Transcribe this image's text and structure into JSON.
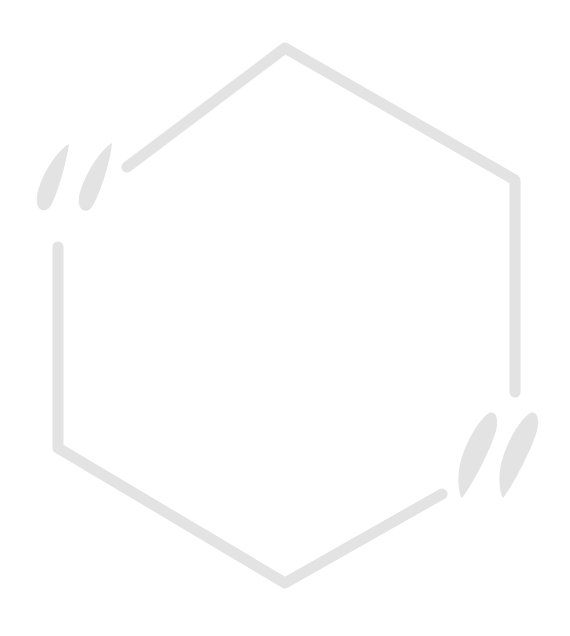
{
  "graphic": {
    "shape": "hexagon-frame",
    "decoration": "quotation-marks",
    "stroke_color": "#e3e3e3",
    "fill_color": "#e3e3e3",
    "background_color": "#ffffff"
  }
}
